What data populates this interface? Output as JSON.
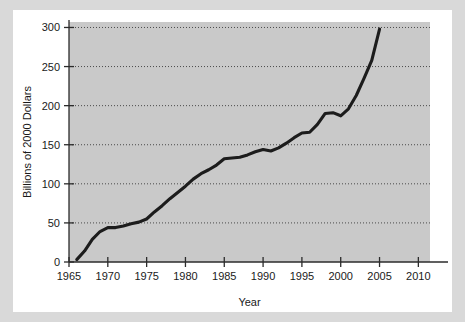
{
  "figure": {
    "background_color": "#d9d9d9",
    "card_color": "#ffffff",
    "plot_background_color": "#c9c9c9",
    "line_color": "#1c1c1c"
  },
  "chart_data": {
    "type": "line",
    "title": "",
    "xlabel": "Year",
    "ylabel": "Billions of 2000 Dollars",
    "xlim": [
      1965,
      2011.5
    ],
    "ylim": [
      0,
      307
    ],
    "xticks": [
      1965,
      1970,
      1975,
      1980,
      1985,
      1990,
      1995,
      2000,
      2005,
      2010
    ],
    "xtick_labels": [
      "1965",
      "1970",
      "1975",
      "1980",
      "1985",
      "1990",
      "1995",
      "2000",
      "2005",
      "2010"
    ],
    "yticks": [
      0,
      50,
      100,
      150,
      200,
      250,
      300
    ],
    "ytick_labels": [
      "0",
      "50",
      "100",
      "150",
      "200",
      "250",
      "300"
    ],
    "grid": "horizontal-dotted",
    "legend": "none",
    "series": [
      {
        "name": "Billions of 2000 Dollars",
        "x": [
          1966,
          1967,
          1968,
          1969,
          1970,
          1971,
          1972,
          1973,
          1974,
          1975,
          1976,
          1977,
          1978,
          1979,
          1980,
          1981,
          1982,
          1983,
          1984,
          1985,
          1986,
          1987,
          1988,
          1989,
          1990,
          1991,
          1992,
          1993,
          1994,
          1995,
          1996,
          1997,
          1998,
          1999,
          2000,
          2001,
          2002,
          2003,
          2004,
          2005
        ],
        "values": [
          3,
          14,
          29,
          39,
          44,
          44,
          46,
          49,
          51,
          55,
          64,
          72,
          81,
          89,
          97,
          106,
          113,
          118,
          124,
          132,
          133,
          134,
          137,
          141,
          144,
          142,
          146,
          152,
          159,
          165,
          166,
          176,
          190,
          191,
          187,
          196,
          213,
          235,
          258,
          298
        ]
      }
    ]
  }
}
